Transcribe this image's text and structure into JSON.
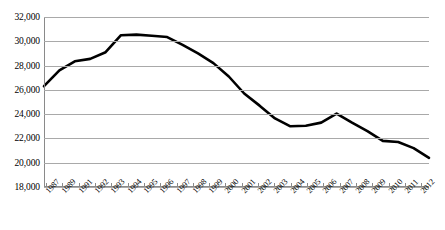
{
  "chart_data": {
    "type": "line",
    "title": "",
    "subtitle": "",
    "xlabel": "",
    "ylabel": "",
    "grid": true,
    "legend": false,
    "ylim": [
      18000,
      32000
    ],
    "ytick_labels": [
      "32,000",
      "30,000",
      "28,000",
      "26,000",
      "24,000",
      "22,000",
      "20,000",
      "18,000"
    ],
    "ytick_values": [
      32000,
      30000,
      28000,
      26000,
      24000,
      22000,
      20000,
      18000
    ],
    "categories": [
      "1987",
      "1988",
      "1989",
      "1990",
      "1991",
      "1992",
      "1993",
      "1994",
      "1995",
      "1996",
      "1997",
      "1998",
      "1999",
      "2000",
      "2001",
      "2002",
      "2003",
      "2004",
      "2005",
      "2006",
      "2007",
      "2008",
      "2009",
      "2010",
      "2011",
      "2012"
    ],
    "xtick_labels": [
      "1987",
      "1989",
      "1991",
      "1992",
      "1993",
      "1994",
      "1995",
      "1996",
      "1997",
      "1998",
      "1999",
      "2000",
      "2001",
      "2002",
      "2003",
      "2004",
      "2005",
      "2006",
      "2007",
      "2008",
      "2009",
      "2010",
      "2011",
      "2012"
    ],
    "values": [
      26300,
      27600,
      28350,
      28550,
      29100,
      30500,
      30550,
      30450,
      30350,
      29700,
      29000,
      28200,
      27100,
      25700,
      24700,
      23650,
      23000,
      23050,
      23300,
      24050,
      23300,
      22600,
      21800,
      21700,
      21200,
      20400
    ],
    "series_color": "#000000",
    "line_width": 2.6
  }
}
